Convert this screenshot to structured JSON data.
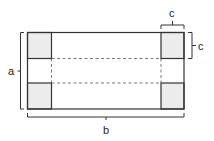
{
  "diagram": {
    "type": "box-net-with-corner-cutouts",
    "labels": {
      "height": "a",
      "width": "b",
      "corner_width": "c",
      "corner_height": "c"
    },
    "colors": {
      "stroke": "#333333",
      "corner_fill": "#ececec",
      "background": "#ffffff"
    },
    "outer_rect": {
      "x": 27,
      "y": 32,
      "width": 157,
      "height": 77
    },
    "corner_size": {
      "w": 24,
      "h": 26
    },
    "fold_lines": [
      "y=58",
      "y=83",
      "x=51",
      "x=161"
    ]
  }
}
